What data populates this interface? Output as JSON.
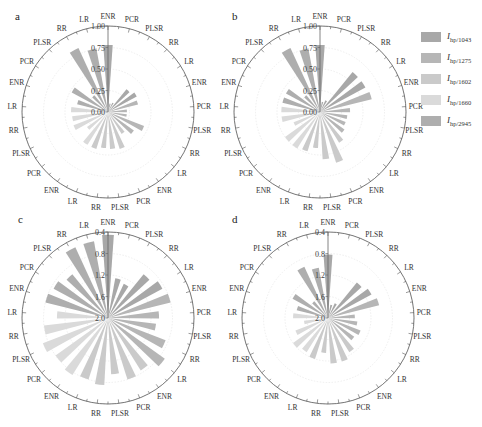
{
  "figure": {
    "legend": {
      "items": [
        {
          "symbol": "I",
          "sub": "hp/1043",
          "color": "#a8a8a8"
        },
        {
          "symbol": "I",
          "sub": "hp/1275",
          "color": "#b6b6b6"
        },
        {
          "symbol": "I",
          "sub": "hp/1602",
          "color": "#cacaca"
        },
        {
          "symbol": "I",
          "sub": "hp/1660",
          "color": "#dadada"
        },
        {
          "symbol": "I",
          "sub": "hp/2945",
          "color": "#aeaeae"
        }
      ]
    }
  },
  "chart_data": [
    {
      "panel": "a",
      "type": "bar",
      "subtype": "polar",
      "center": [
        108,
        112
      ],
      "radius": 86,
      "categories": [
        "ENR",
        "PCR",
        "PLSR",
        "RR",
        "LR",
        "ENR",
        "PCR",
        "PLSR",
        "RR",
        "LR",
        "ENR",
        "PCR",
        "PLSR",
        "RR",
        "LR",
        "ENR",
        "PCR",
        "PLSR",
        "RR",
        "LR",
        "ENR",
        "PCR",
        "PLSR",
        "RR",
        "LR"
      ],
      "group_colors": [
        "#a8a8a8",
        "#b6b6b6",
        "#cacaca",
        "#dadada",
        "#aeaeae"
      ],
      "radial_ticks": [
        "0.00",
        "0.25",
        "0.50",
        "0.75",
        "1.00"
      ],
      "radial_range": [
        0,
        1.0
      ],
      "inverted": false,
      "values": [
        0.78,
        0.1,
        0.12,
        0.34,
        0.38,
        0.36,
        0.22,
        0.22,
        0.45,
        0.37,
        0.3,
        0.45,
        0.43,
        0.42,
        0.45,
        0.45,
        0.3,
        0.43,
        0.42,
        0.43,
        0.37,
        0.48,
        0.25,
        0.82,
        0.75
      ]
    },
    {
      "panel": "b",
      "type": "bar",
      "subtype": "polar",
      "center": [
        320,
        112
      ],
      "radius": 86,
      "categories": [
        "ENR",
        "PCR",
        "PLSR",
        "RR",
        "LR",
        "ENR",
        "PCR",
        "PLSR",
        "RR",
        "LR",
        "ENR",
        "PCR",
        "PLSR",
        "RR",
        "LR",
        "ENR",
        "PCR",
        "PLSR",
        "RR",
        "LR",
        "ENR",
        "PCR",
        "PLSR",
        "RR",
        "LR"
      ],
      "group_colors": [
        "#a8a8a8",
        "#b6b6b6",
        "#cacaca",
        "#dadada",
        "#aeaeae"
      ],
      "radial_ticks": [
        "0.00",
        "0.25",
        "0.50",
        "0.75",
        "1.00"
      ],
      "radial_range": [
        0,
        1.0
      ],
      "inverted": false,
      "values": [
        0.78,
        0.12,
        0.15,
        0.6,
        0.6,
        0.62,
        0.35,
        0.32,
        0.32,
        0.35,
        0.42,
        0.62,
        0.55,
        0.42,
        0.48,
        0.5,
        0.5,
        0.33,
        0.45,
        0.45,
        0.45,
        0.45,
        0.25,
        0.82,
        0.75
      ]
    },
    {
      "panel": "c",
      "type": "bar",
      "subtype": "polar",
      "center": [
        108,
        318
      ],
      "radius": 86,
      "categories": [
        "ENR",
        "PCR",
        "PLSR",
        "RR",
        "LR",
        "ENR",
        "PCR",
        "PLSR",
        "RR",
        "LR",
        "ENR",
        "PCR",
        "PLSR",
        "RR",
        "LR",
        "ENR",
        "PCR",
        "PLSR",
        "RR",
        "LR",
        "ENR",
        "PCR",
        "PLSR",
        "RR",
        "LR"
      ],
      "group_colors": [
        "#a8a8a8",
        "#b6b6b6",
        "#cacaca",
        "#dadada",
        "#aeaeae"
      ],
      "radial_ticks": [
        "2.0",
        "1.6",
        "1.2",
        "0.8",
        "0.4"
      ],
      "radial_range": [
        2.0,
        0.4
      ],
      "inverted": true,
      "values": [
        0.45,
        1.25,
        1.3,
        0.95,
        0.85,
        0.8,
        1.05,
        1.1,
        0.85,
        0.7,
        0.85,
        0.8,
        0.95,
        0.75,
        0.8,
        0.75,
        0.8,
        0.7,
        0.8,
        1.05,
        0.8,
        0.85,
        0.95,
        0.55,
        0.55
      ]
    },
    {
      "panel": "d",
      "type": "bar",
      "subtype": "polar",
      "center": [
        328,
        318
      ],
      "radius": 86,
      "categories": [
        "ENR",
        "PCR",
        "PLSR",
        "RR",
        "LR",
        "ENR",
        "PCR",
        "PLSR",
        "RR",
        "LR",
        "ENR",
        "PCR",
        "PLSR",
        "RR",
        "LR",
        "ENR",
        "PCR",
        "PLSR",
        "RR",
        "LR",
        "ENR",
        "PCR",
        "PLSR",
        "RR",
        "LR"
      ],
      "group_colors": [
        "#a8a8a8",
        "#b6b6b6",
        "#cacaca",
        "#dadada",
        "#aeaeae"
      ],
      "radial_ticks": [
        "2.0",
        "1.6",
        "1.2",
        "0.8",
        "0.4"
      ],
      "radial_range": [
        2.0,
        0.4
      ],
      "inverted": true,
      "values": [
        0.82,
        1.75,
        1.7,
        1.15,
        1.08,
        1.02,
        1.5,
        1.45,
        1.35,
        1.4,
        1.25,
        1.15,
        1.15,
        1.35,
        1.2,
        1.25,
        1.2,
        1.35,
        1.55,
        1.35,
        1.4,
        1.25,
        1.6,
        0.95,
        1.05
      ]
    }
  ]
}
